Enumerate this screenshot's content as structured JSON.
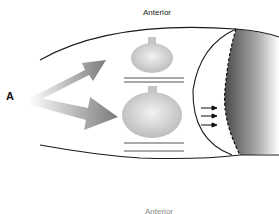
{
  "diagram": {
    "panel_letter": "A",
    "top_label": "Anterior",
    "bottom_label": "Anterior",
    "elements": {
      "outline": "elongated body outline with curved top and bottom edges",
      "arrows_large": [
        "upper-right gradient arrow",
        "right gradient arrow"
      ],
      "bulbs": [
        "small bulb with double underline",
        "large bulb with double underline"
      ],
      "small_arrows_count": 3,
      "shaded_region": "dark-to-light gradient region with dashed left boundary"
    },
    "colors": {
      "outline": "#1a1a1a",
      "arrow_gradient_start": "#ffffff",
      "arrow_gradient_end": "#7a7a7a",
      "bulb": "#c8c8c8",
      "underline": "#555555",
      "shade_dark": "#555555",
      "shade_light": "#ffffff"
    }
  }
}
